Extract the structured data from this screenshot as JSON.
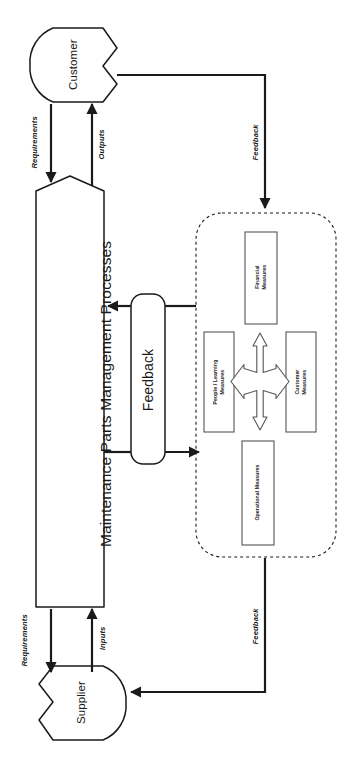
{
  "diagram": {
    "title": "Maintenance Parts Management Processes",
    "orientation": "rotated-90-ccw",
    "entities": {
      "customer": "Customer",
      "supplier": "Supplier"
    },
    "process": {
      "label": "Maintenance Parts Management Processes"
    },
    "feedback_box": {
      "label": "Feedback"
    },
    "flow_labels": {
      "requirements_customer": "Requirements",
      "outputs": "Outputs",
      "requirements_supplier": "Requirements",
      "inputs": "Inputs",
      "feedback_customer": "Feedback",
      "feedback_supplier": "Feedback"
    },
    "measures_panel": {
      "financial": "Financial\nMeasures",
      "people_learning": "People / Learning\nMeasures",
      "customer": "Customer\nMeasures",
      "operational": "Operational Measures",
      "center_icon": "four-way-arrow-icon"
    },
    "colors": {
      "stroke": "#1a1a1a",
      "fill": "#ffffff",
      "background": "#ffffff"
    }
  }
}
